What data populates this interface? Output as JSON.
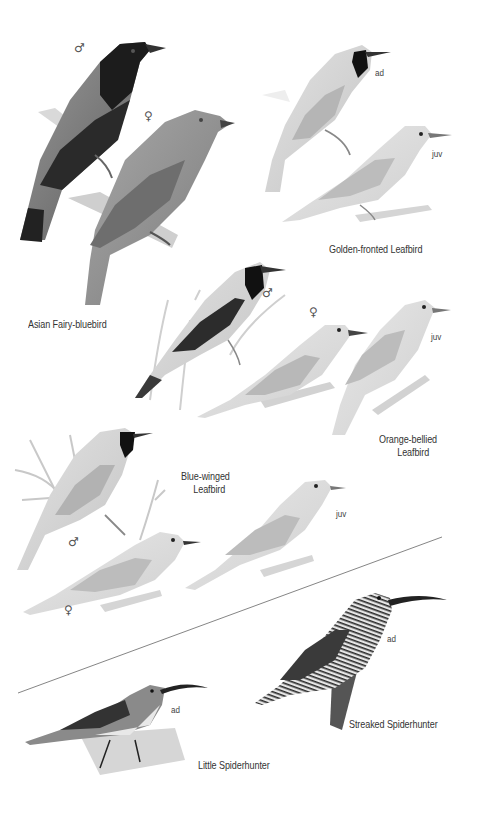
{
  "plate": {
    "species": [
      {
        "name": "Asian Fairy-bluebird",
        "figures": [
          {
            "label": "♂",
            "type": "sex"
          },
          {
            "label": "♀",
            "type": "sex"
          }
        ]
      },
      {
        "name": "Golden-fronted Leafbird",
        "figures": [
          {
            "label": "ad",
            "type": "age"
          },
          {
            "label": "juv",
            "type": "age"
          }
        ]
      },
      {
        "name_line1": "Orange-bellied",
        "name_line2": "Leafbird",
        "figures": [
          {
            "label": "♂",
            "type": "sex"
          },
          {
            "label": "♀",
            "type": "sex"
          },
          {
            "label": "juv",
            "type": "age"
          }
        ]
      },
      {
        "name_line1": "Blue-winged",
        "name_line2": "Leafbird",
        "figures": [
          {
            "label": "♂",
            "type": "sex"
          },
          {
            "label": "♀",
            "type": "sex"
          },
          {
            "label": "juv",
            "type": "age"
          }
        ]
      },
      {
        "name": "Streaked Spiderhunter",
        "figures": [
          {
            "label": "ad",
            "type": "age"
          }
        ]
      },
      {
        "name": "Little Spiderhunter",
        "figures": [
          {
            "label": "ad",
            "type": "age"
          }
        ]
      }
    ]
  },
  "colors": {
    "background": "#ffffff",
    "label_text": "#333333",
    "divider": "#777777"
  }
}
